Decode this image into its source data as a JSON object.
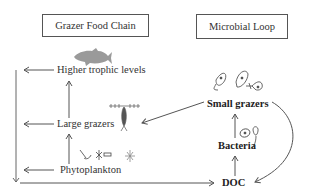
{
  "diagram": {
    "sections": {
      "grazer_food_chain": {
        "title": "Grazer Food Chain"
      },
      "microbial_loop": {
        "title": "Microbial Loop"
      }
    },
    "nodes": {
      "higher_trophic_levels": "Higher trophic levels",
      "large_grazers": "Large grazers",
      "phytoplankton": "Phytoplankton",
      "small_grazers": "Small grazers",
      "bacteria": "Bacteria",
      "doc": "DOC"
    },
    "icons": [
      "fish-icon",
      "copepod-icon",
      "phytoplankton-cells-icon",
      "ciliate-icons",
      "bacteria-icons"
    ],
    "edges": [
      {
        "from": "Phytoplankton",
        "to": "Large grazers"
      },
      {
        "from": "Large grazers",
        "to": "Higher trophic levels"
      },
      {
        "from": "Small grazers",
        "to": "Large grazers"
      },
      {
        "from": "Bacteria",
        "to": "Small grazers"
      },
      {
        "from": "DOC",
        "to": "Bacteria"
      },
      {
        "from": "Small grazers",
        "to": "DOC"
      },
      {
        "from": "Higher trophic levels",
        "to": "DOC"
      },
      {
        "from": "Large grazers",
        "to": "DOC"
      },
      {
        "from": "Phytoplankton",
        "to": "DOC"
      }
    ],
    "colors": {
      "line": "#555555",
      "fish": "#9a9a9a",
      "text": "#333333"
    }
  }
}
